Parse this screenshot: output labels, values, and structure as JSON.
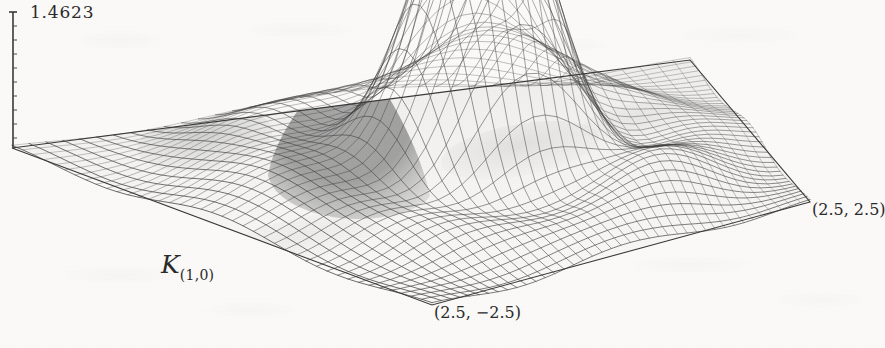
{
  "figure": {
    "background_color": "#fbfaf8",
    "ink_color": "#3a3a3a",
    "surface_label": "K",
    "surface_label_subscript": "(1,0)",
    "z_max_label": "1.4623",
    "corner_label_right": "(2.5, 2.5)",
    "corner_label_front": "(2.5, −2.5)"
  },
  "chart_data": {
    "type": "surface",
    "title": "",
    "subtitle": "",
    "xlabel": "",
    "ylabel": "",
    "zlabel": "K(1,0)",
    "grid": true,
    "legend": false,
    "legend_position": "none",
    "projection": "axonometric",
    "annotations": [
      {
        "text": "1.4623",
        "role": "z-axis-max-tick",
        "x_px": 30,
        "y_px": 2
      },
      {
        "text": "K(1,0)",
        "role": "surface-name",
        "x_px": 161,
        "y_px": 250
      },
      {
        "text": "(2.5, 2.5)",
        "role": "right-corner-coordinate",
        "x_px": 812,
        "y_px": 200
      },
      {
        "text": "(2.5, -2.5)",
        "role": "front-corner-coordinate",
        "x_px": 434,
        "y_px": 303
      }
    ],
    "zlim": [
      0,
      1.4623
    ],
    "xlim": [
      -2.5,
      2.5
    ],
    "ylim": [
      -2.5,
      2.5
    ],
    "x_ticks": [
      -2.5,
      2.5
    ],
    "y_ticks": [
      -2.5,
      2.5
    ],
    "z_ticks": [
      0,
      1.4623
    ],
    "mesh_rows": 40,
    "mesh_cols": 40,
    "peak": {
      "x": 0.25,
      "y": -0.1,
      "z": 1.4623
    },
    "secondary_lobes": [
      {
        "x": -1.1,
        "y": -0.5,
        "z": 0.42
      },
      {
        "x": -0.2,
        "y": 1.3,
        "z": 0.18
      },
      {
        "x": 1.4,
        "y": -0.9,
        "z": 0.16
      },
      {
        "x": -1.9,
        "y": 0.9,
        "z": 0.1
      }
    ]
  }
}
